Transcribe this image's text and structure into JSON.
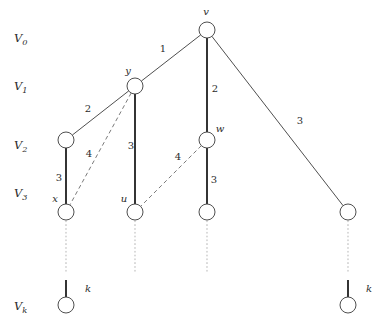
{
  "diagram": {
    "colors": {
      "stroke": "#3b3b3b",
      "tree_edge": "#2b2b2b",
      "dashed_edge": "#6b6b6b",
      "dotted_edge": "#c8c8c8",
      "node_fill": "#ffffff",
      "text": "#2b2b2b"
    },
    "axis_labels": [
      {
        "id": "V0",
        "base": "V",
        "sub": "0",
        "x": 14,
        "y": 42
      },
      {
        "id": "V1",
        "base": "V",
        "sub": "1",
        "x": 14,
        "y": 90
      },
      {
        "id": "V2",
        "base": "V",
        "sub": "2",
        "x": 14,
        "y": 149
      },
      {
        "id": "V3",
        "base": "V",
        "sub": "3",
        "x": 14,
        "y": 197
      },
      {
        "id": "Vk",
        "base": "V",
        "sub": "k",
        "x": 14,
        "y": 310
      }
    ],
    "nodes": [
      {
        "id": "v",
        "label": "v",
        "x": 207,
        "y": 30,
        "r": 8,
        "label_x": 206,
        "label_y": 15,
        "label_anchor": "middle"
      },
      {
        "id": "y",
        "label": "y",
        "x": 135,
        "y": 86,
        "r": 8,
        "label_x": 128,
        "label_y": 74,
        "label_anchor": "middle"
      },
      {
        "id": "a2",
        "label": "",
        "x": 66,
        "y": 140,
        "r": 8,
        "label_x": 0,
        "label_y": 0,
        "label_anchor": "middle"
      },
      {
        "id": "w",
        "label": "w",
        "x": 207,
        "y": 140,
        "r": 8,
        "label_x": 220,
        "label_y": 132,
        "label_anchor": "middle"
      },
      {
        "id": "x",
        "label": "x",
        "x": 66,
        "y": 212,
        "r": 8,
        "label_x": 55,
        "label_y": 202,
        "label_anchor": "middle"
      },
      {
        "id": "u",
        "label": "u",
        "x": 135,
        "y": 212,
        "r": 8,
        "label_x": 124,
        "label_y": 202,
        "label_anchor": "middle"
      },
      {
        "id": "b3",
        "label": "",
        "x": 207,
        "y": 212,
        "r": 8,
        "label_x": 0,
        "label_y": 0,
        "label_anchor": "middle"
      },
      {
        "id": "c3",
        "label": "",
        "x": 348,
        "y": 212,
        "r": 8,
        "label_x": 0,
        "label_y": 0,
        "label_anchor": "middle"
      },
      {
        "id": "kl",
        "label": "",
        "x": 66,
        "y": 305,
        "r": 8,
        "label_x": 0,
        "label_y": 0,
        "label_anchor": "middle"
      },
      {
        "id": "kr",
        "label": "",
        "x": 348,
        "y": 305,
        "r": 8,
        "label_x": 0,
        "label_y": 0,
        "label_anchor": "middle"
      }
    ],
    "edges": [
      {
        "id": "v-y",
        "from": "v",
        "to": "y",
        "style": "solid",
        "label": "1",
        "label_x": 163,
        "label_y": 52
      },
      {
        "id": "v-w",
        "from": "v",
        "to": "w",
        "style": "tree",
        "label": "2",
        "label_x": 215,
        "label_y": 92
      },
      {
        "id": "v-c3",
        "from": "v",
        "to": "c3",
        "style": "solid",
        "label": "3",
        "label_x": 300,
        "label_y": 124
      },
      {
        "id": "y-a2",
        "from": "y",
        "to": "a2",
        "style": "solid",
        "label": "2",
        "label_x": 88,
        "label_y": 112
      },
      {
        "id": "y-u",
        "from": "y",
        "to": "u",
        "style": "tree",
        "label": "3",
        "label_x": 131,
        "label_y": 149
      },
      {
        "id": "y-x",
        "from": "y",
        "to": "x",
        "style": "dashed",
        "label": "4",
        "label_x": 89,
        "label_y": 157
      },
      {
        "id": "a2-x",
        "from": "a2",
        "to": "x",
        "style": "tree",
        "label": "3",
        "label_x": 59,
        "label_y": 181
      },
      {
        "id": "w-b3",
        "from": "w",
        "to": "b3",
        "style": "tree",
        "label": "3",
        "label_x": 214,
        "label_y": 183
      },
      {
        "id": "w-u",
        "from": "w",
        "to": "u",
        "style": "dashed",
        "label": "4",
        "label_x": 178,
        "label_y": 160
      }
    ],
    "continuations": [
      {
        "id": "cont-x",
        "x": 66,
        "y1": 221,
        "y2": 272,
        "stub_y1": 280,
        "stub_y2": 297,
        "label": "k",
        "label_x": 88,
        "label_y": 292
      },
      {
        "id": "cont-u",
        "x": 135,
        "y1": 221,
        "y2": 272,
        "stub_y1": 0,
        "stub_y2": 0,
        "label": "",
        "label_x": 0,
        "label_y": 0
      },
      {
        "id": "cont-b",
        "x": 207,
        "y1": 221,
        "y2": 272,
        "stub_y1": 0,
        "stub_y2": 0,
        "label": "",
        "label_x": 0,
        "label_y": 0
      },
      {
        "id": "cont-c",
        "x": 348,
        "y1": 221,
        "y2": 272,
        "stub_y1": 280,
        "stub_y2": 297,
        "label": "k",
        "label_x": 369,
        "label_y": 292
      }
    ]
  },
  "chart_data": {
    "type": "diagram",
    "levels": [
      "V0",
      "V1",
      "V2",
      "V3",
      "Vk"
    ],
    "nodes": [
      "v",
      "y",
      "w",
      "x",
      "u"
    ],
    "edge_weights": [
      {
        "edge": "v-y",
        "weight": 1,
        "kind": "solid"
      },
      {
        "edge": "v-w",
        "weight": 2,
        "kind": "tree"
      },
      {
        "edge": "v-right",
        "weight": 3,
        "kind": "solid"
      },
      {
        "edge": "y-left",
        "weight": 2,
        "kind": "solid"
      },
      {
        "edge": "y-u",
        "weight": 3,
        "kind": "tree"
      },
      {
        "edge": "y-x",
        "weight": 4,
        "kind": "dashed"
      },
      {
        "edge": "left-x",
        "weight": 3,
        "kind": "tree"
      },
      {
        "edge": "w-down",
        "weight": 3,
        "kind": "tree"
      },
      {
        "edge": "w-u",
        "weight": 4,
        "kind": "dashed"
      }
    ],
    "continuation_labels": [
      "k",
      "k"
    ]
  }
}
